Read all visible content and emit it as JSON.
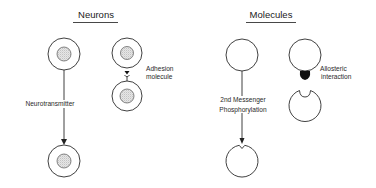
{
  "panels": {
    "neurons": {
      "title": "Neurons",
      "labels": {
        "neurotransmitter": "Neurotransmitter",
        "adhesion_line1": "Adhesion",
        "adhesion_line2": "molecule"
      }
    },
    "molecules": {
      "title": "Molecules",
      "labels": {
        "second_messenger": "2nd Messenger",
        "phosphorylation": "Phosphorylation",
        "allosteric_line1": "Allosteric",
        "allosteric_line2": "interaction"
      }
    }
  },
  "colors": {
    "ink": "#2b2b2b",
    "nucleus_fill": "#d9d9d9",
    "background": "#ffffff"
  }
}
